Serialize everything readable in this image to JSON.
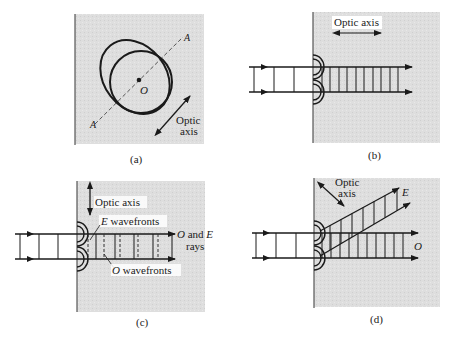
{
  "colors": {
    "crystal_fill": "#dcdcdc",
    "ink": "#1a1a1a",
    "dash": "#555555",
    "background": "#ffffff"
  },
  "panels": [
    {
      "id": "a",
      "caption": "(a)",
      "labels": {
        "axis_top": "A",
        "axis_bottom": "A",
        "center": "O",
        "optic_axis_line1": "Optic",
        "optic_axis_line2": "axis"
      },
      "shapes": [
        "circle (O wave surface)",
        "ellipse (E wave surface)",
        "dashed line A–A",
        "double arrow (optic axis)"
      ]
    },
    {
      "id": "b",
      "caption": "(b)",
      "labels": {
        "optic_axis": "Optic axis"
      },
      "wavefronts_outside": 3,
      "wavefronts_inside": 10
    },
    {
      "id": "c",
      "caption": "(c)",
      "labels": {
        "optic_axis": "Optic axis",
        "e_wavefronts_italic": "E",
        "e_wavefronts_text": " wavefronts",
        "o_wavefronts_italic": "O",
        "o_wavefronts_text": " wavefronts",
        "rays_o": "O",
        "rays_and": " and ",
        "rays_e": "E",
        "rays_line2": "rays"
      }
    },
    {
      "id": "d",
      "caption": "(d)",
      "labels": {
        "optic_axis_line1": "Optic",
        "optic_axis_line2": "axis",
        "e_ray": "E",
        "o_ray": "O"
      }
    }
  ]
}
